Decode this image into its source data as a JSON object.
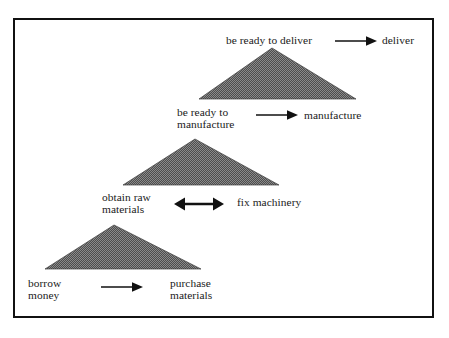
{
  "figure": {
    "type": "layered-triangle-diagram",
    "border_color": "#111111",
    "triangle_fill": "#5a5a5a",
    "background": "#ffffff",
    "levels": [
      {
        "name": "deliver-level",
        "precondition_label": "be ready to deliver",
        "action_label": "deliver",
        "arrow": "single-right",
        "triangle": {
          "apex_x": 272,
          "apex_y": 48,
          "left_x": 199,
          "right_x": 356,
          "base_y": 99
        }
      },
      {
        "name": "manufacture-level",
        "precondition_label": "be ready to\nmanufacture",
        "action_label": "manufacture",
        "arrow": "single-right",
        "triangle": {
          "apex_x": 195,
          "apex_y": 139,
          "left_x": 123,
          "right_x": 279,
          "base_y": 185
        }
      },
      {
        "name": "raw-materials-level",
        "precondition_label": "obtain raw\nmaterials",
        "action_label": "fix machinery",
        "arrow": "double-headed",
        "triangle": {
          "apex_x": 114,
          "apex_y": 225,
          "left_x": 45,
          "right_x": 201,
          "base_y": 269
        }
      },
      {
        "name": "borrow-level",
        "precondition_label": "borrow\nmoney",
        "action_label": "purchase\nmaterials",
        "arrow": "single-right",
        "triangle": null
      }
    ]
  },
  "labels": {
    "be_ready_to_deliver": "be ready to deliver",
    "deliver": "deliver",
    "be_ready_to_manufacture": "be ready to\nmanufacture",
    "manufacture": "manufacture",
    "obtain_raw_materials": "obtain raw\nmaterials",
    "fix_machinery": "fix machinery",
    "borrow_money": "borrow\nmoney",
    "purchase_materials": "purchase\nmaterials"
  },
  "arrows": {
    "deliver_arrow": "arrow-right",
    "manufacture_arrow": "arrow-right",
    "machinery_arrow": "arrow-left-right",
    "purchase_arrow": "arrow-right"
  }
}
